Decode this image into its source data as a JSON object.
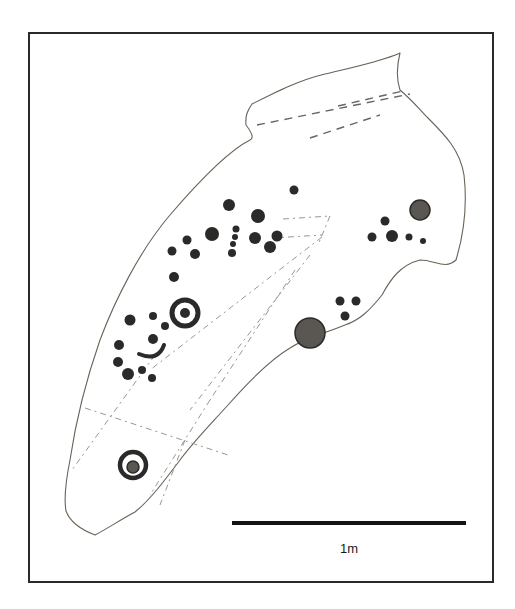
{
  "figure": {
    "type": "rock-art-panel-drawing",
    "colors": {
      "frame": "#2a2a2a",
      "outline": "#6b6258",
      "motif": "#2b2a28",
      "fracture": "#6b6560",
      "background": "#ffffff"
    },
    "motifs": {
      "cup_and_ring_count": 2,
      "large_cupmark_count": 2,
      "arc_groove_count": 1
    },
    "scale_bar": {
      "label": "1m",
      "length_px": 232
    }
  }
}
